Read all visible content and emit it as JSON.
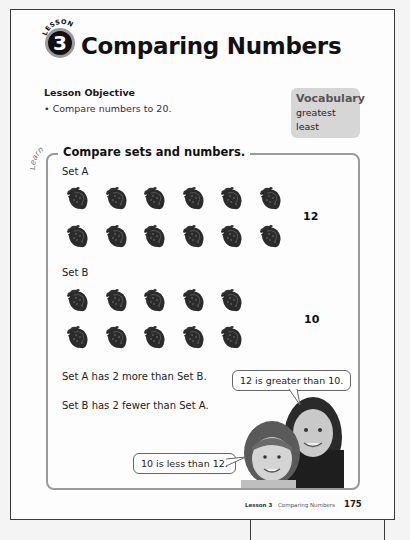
{
  "header": {
    "lesson_word": "LESSON",
    "lesson_number": "3",
    "title": "Comparing Numbers"
  },
  "objective": {
    "heading": "Lesson Objective",
    "items": [
      "Compare numbers to 20."
    ]
  },
  "vocabulary": {
    "heading": "Vocabulary",
    "words": [
      "greatest",
      "least"
    ]
  },
  "learn": {
    "tag": "Learn",
    "title": "Compare sets and numbers.",
    "sets": [
      {
        "label": "Set A",
        "count": "12",
        "item_icon": "strawberry-icon",
        "rows": [
          6,
          6
        ]
      },
      {
        "label": "Set B",
        "count": "10",
        "item_icon": "strawberry-icon",
        "rows": [
          5,
          5
        ]
      }
    ],
    "statements": [
      "Set A has 2 more than Set B.",
      "Set B has 2 fewer than Set A."
    ],
    "speech_bubbles": [
      "12 is greater than 10.",
      "10 is less than 12."
    ]
  },
  "footer": {
    "lesson_label": "Lesson 3",
    "lesson_title": "Comparing Numbers",
    "page_number": "175"
  }
}
